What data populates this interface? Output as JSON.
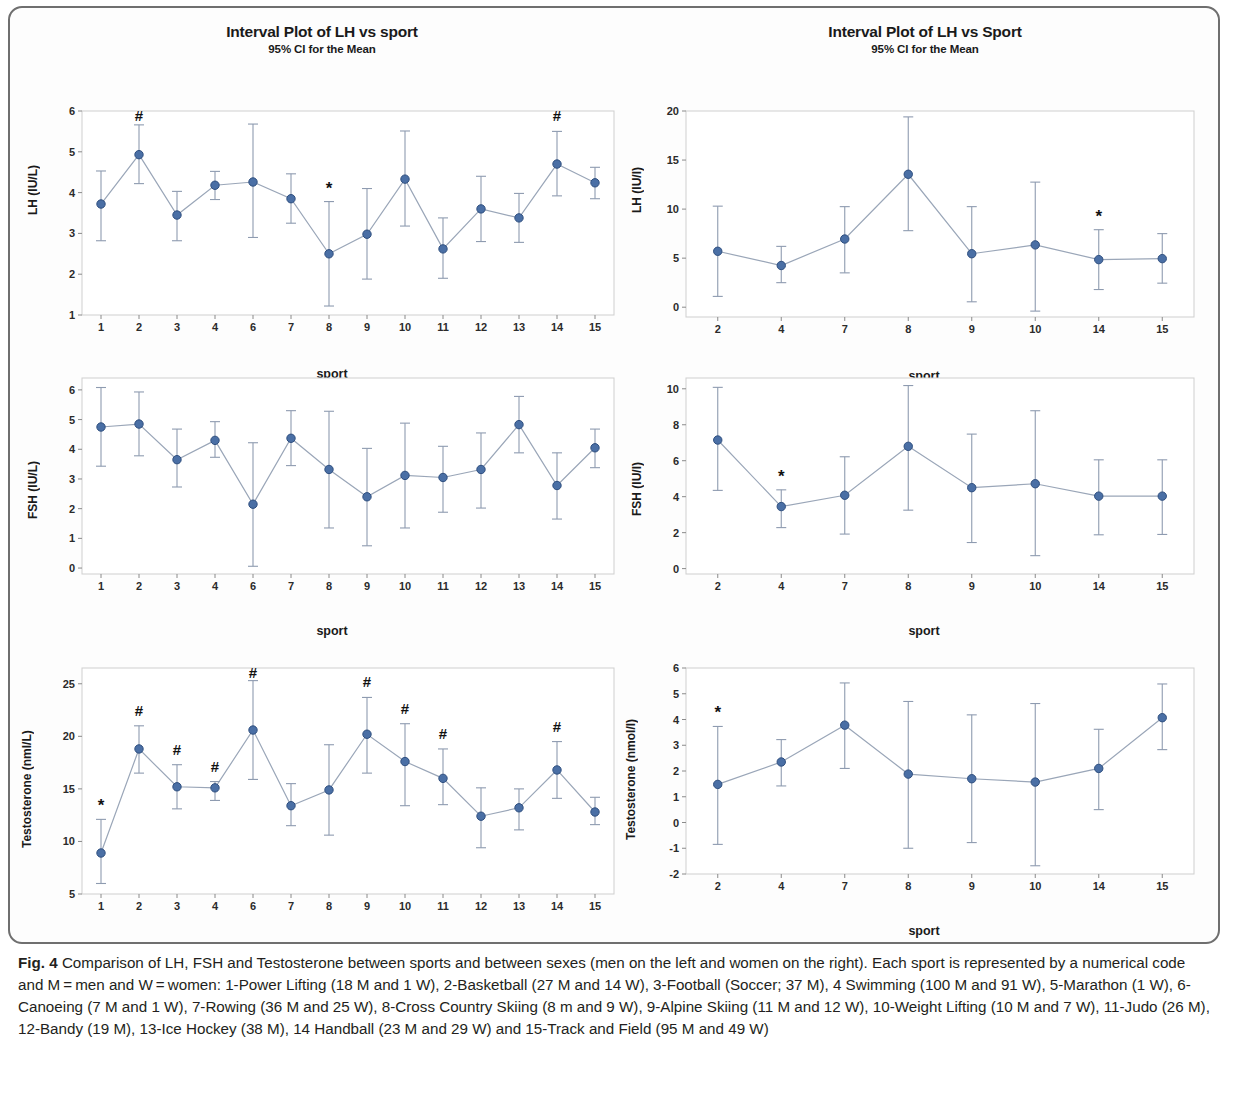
{
  "figure": {
    "label": "Fig. 4",
    "caption": " Comparison of LH, FSH and Testosterone between sports and between sexes (men on the left and women on the right). Each sport is represented by a numerical code and M = men and W = women: 1-Power Lifting (18 M and 1 W), 2-Basketball (27 M and 14 W), 3-Football (Soccer; 37 M), 4 Swimming (100 M and 91 W), 5-Marathon (1 W), 6-Canoeing (7 M and 1 W), 7-Rowing (36 M and 25 W), 8-Cross Country Skiing (8 m and 9 W), 9-Alpine Skiing (11 M and 12 W), 10-Weight Lifting (10 M and 7 W), 11-Judo (26 M), 12-Bandy (19 M), 13-Ice Hockey (38 M), 14 Handball (23 M and 29 W) and 15-Track and Field (95 M and 49 W)"
  },
  "style": {
    "marker_color": "#4a6fa5",
    "marker_edge": "#2f4f7f",
    "line_color": "#9aa6b8",
    "error_color": "#8e9bb0",
    "frame_color": "#cfcfcf"
  },
  "chart_data": [
    {
      "id": "lh-men",
      "type": "line",
      "title": "Interval Plot of LH vs sport",
      "subtitle": "95% CI for the Mean",
      "xlabel": "sport",
      "ylabel": "LH (IU/L)",
      "ylim": [
        1,
        6
      ],
      "yticks": [
        1,
        2,
        3,
        4,
        5,
        6
      ],
      "grid": false,
      "categories": [
        "1",
        "2",
        "3",
        "4",
        "6",
        "7",
        "8",
        "9",
        "10",
        "11",
        "12",
        "13",
        "14",
        "15"
      ],
      "values": [
        3.72,
        4.93,
        3.45,
        4.18,
        4.26,
        3.85,
        2.5,
        2.98,
        4.33,
        2.62,
        3.6,
        3.38,
        4.7,
        4.24
      ],
      "ci_low": [
        2.82,
        4.22,
        2.82,
        3.83,
        2.9,
        3.25,
        1.22,
        1.88,
        3.18,
        1.9,
        2.8,
        2.78,
        3.92,
        3.85
      ],
      "ci_high": [
        4.53,
        5.66,
        4.03,
        4.52,
        5.68,
        4.46,
        3.78,
        4.1,
        5.51,
        3.38,
        4.4,
        3.98,
        5.5,
        4.62
      ],
      "annotations": [
        {
          "category": "2",
          "symbol": "#"
        },
        {
          "category": "8",
          "symbol": "*"
        },
        {
          "category": "14",
          "symbol": "#"
        }
      ]
    },
    {
      "id": "lh-women",
      "type": "line",
      "title": "Interval Plot of LH vs Sport",
      "subtitle": "95% CI for the Mean",
      "xlabel": "sport",
      "ylabel": "LH (IU/l)",
      "ylim": [
        -1,
        20
      ],
      "yticks": [
        0,
        5,
        10,
        15,
        20
      ],
      "grid": false,
      "categories": [
        "2",
        "4",
        "7",
        "8",
        "9",
        "10",
        "14",
        "15"
      ],
      "values": [
        5.7,
        4.25,
        6.95,
        13.55,
        5.45,
        6.35,
        4.85,
        4.95
      ],
      "ci_low": [
        1.1,
        2.5,
        3.5,
        7.8,
        0.55,
        -0.4,
        1.8,
        2.45
      ],
      "ci_high": [
        10.3,
        6.2,
        10.25,
        19.4,
        10.25,
        12.75,
        7.9,
        7.5
      ],
      "annotations": [
        {
          "category": "14",
          "symbol": "*"
        }
      ]
    },
    {
      "id": "fsh-men",
      "type": "line",
      "title": "",
      "subtitle": "",
      "xlabel": "sport",
      "ylabel": "FSH (IU/L)",
      "ylim": [
        -0.2,
        6.4
      ],
      "yticks": [
        0,
        1,
        2,
        3,
        4,
        5,
        6
      ],
      "grid": false,
      "categories": [
        "1",
        "2",
        "3",
        "4",
        "6",
        "7",
        "8",
        "9",
        "10",
        "11",
        "12",
        "13",
        "14",
        "15"
      ],
      "values": [
        4.75,
        4.85,
        3.65,
        4.3,
        2.15,
        4.37,
        3.32,
        2.4,
        3.12,
        3.05,
        3.32,
        4.83,
        2.78,
        4.05
      ],
      "ci_low": [
        3.43,
        3.78,
        2.73,
        3.73,
        0.06,
        3.45,
        1.35,
        0.75,
        1.35,
        1.88,
        2.02,
        3.88,
        1.65,
        3.38
      ],
      "ci_high": [
        6.08,
        5.93,
        4.68,
        4.93,
        4.22,
        5.3,
        5.28,
        4.03,
        4.88,
        4.1,
        4.55,
        5.78,
        3.88,
        4.68
      ],
      "annotations": []
    },
    {
      "id": "fsh-women",
      "type": "line",
      "title": "",
      "subtitle": "",
      "xlabel": "sport",
      "ylabel": "FSH (IU/l)",
      "ylim": [
        -0.3,
        10.6
      ],
      "yticks": [
        0,
        2,
        4,
        6,
        8,
        10
      ],
      "grid": false,
      "categories": [
        "2",
        "4",
        "7",
        "8",
        "9",
        "10",
        "14",
        "15"
      ],
      "values": [
        7.15,
        3.45,
        4.08,
        6.8,
        4.5,
        4.72,
        4.03,
        4.03
      ],
      "ci_low": [
        4.35,
        2.28,
        1.92,
        3.25,
        1.45,
        0.72,
        1.88,
        1.9
      ],
      "ci_high": [
        10.08,
        4.38,
        6.22,
        10.18,
        7.48,
        8.78,
        6.05,
        6.05
      ],
      "annotations": [
        {
          "category": "4",
          "symbol": "*"
        }
      ]
    },
    {
      "id": "testosterone-men",
      "type": "line",
      "title": "",
      "subtitle": "",
      "xlabel": "",
      "ylabel": "Testosterone (nml/L)",
      "ylim": [
        5,
        26.5
      ],
      "yticks": [
        5,
        10,
        15,
        20,
        25
      ],
      "grid": false,
      "categories": [
        "1",
        "2",
        "3",
        "4",
        "6",
        "7",
        "8",
        "9",
        "10",
        "11",
        "12",
        "13",
        "14",
        "15"
      ],
      "values": [
        8.9,
        18.8,
        15.2,
        15.1,
        20.6,
        13.4,
        14.9,
        20.2,
        17.6,
        16.0,
        12.4,
        13.2,
        16.8,
        12.8
      ],
      "ci_low": [
        6.0,
        16.5,
        13.1,
        13.9,
        15.9,
        11.5,
        10.6,
        16.5,
        13.4,
        13.5,
        9.4,
        11.1,
        14.1,
        11.6
      ],
      "ci_high": [
        12.1,
        21.0,
        17.3,
        15.7,
        25.3,
        15.5,
        19.2,
        23.7,
        21.2,
        18.8,
        15.1,
        15.0,
        19.5,
        14.2
      ],
      "annotations": [
        {
          "category": "1",
          "symbol": "*"
        },
        {
          "category": "2",
          "symbol": "#"
        },
        {
          "category": "3",
          "symbol": "#"
        },
        {
          "category": "4",
          "symbol": "#"
        },
        {
          "category": "6",
          "symbol": "#"
        },
        {
          "category": "9",
          "symbol": "#"
        },
        {
          "category": "10",
          "symbol": "#"
        },
        {
          "category": "11",
          "symbol": "#"
        },
        {
          "category": "14",
          "symbol": "#"
        }
      ]
    },
    {
      "id": "testosterone-women",
      "type": "line",
      "title": "",
      "subtitle": "",
      "xlabel": "sport",
      "ylabel": "Testosterone (nmol/l)",
      "ylim": [
        -2,
        6
      ],
      "yticks": [
        -2,
        -1,
        0,
        1,
        2,
        3,
        4,
        5,
        6
      ],
      "ytick_labels": [
        "-2",
        "-1",
        "0",
        "1",
        "2",
        "3",
        "4",
        "5",
        "6"
      ],
      "grid": false,
      "categories": [
        "2",
        "4",
        "7",
        "8",
        "9",
        "10",
        "14",
        "15"
      ],
      "values": [
        1.48,
        2.35,
        3.78,
        1.88,
        1.7,
        1.57,
        2.1,
        4.07
      ],
      "ci_low": [
        -0.85,
        1.42,
        2.1,
        -1.0,
        -0.78,
        -1.68,
        0.5,
        2.83
      ],
      "ci_high": [
        3.73,
        3.22,
        5.42,
        4.7,
        4.18,
        4.62,
        3.62,
        5.38
      ],
      "annotations": [
        {
          "category": "2",
          "symbol": "*"
        }
      ]
    }
  ]
}
